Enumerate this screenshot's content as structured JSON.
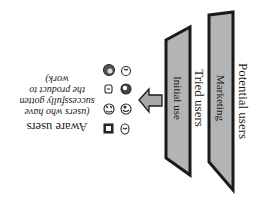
{
  "diagram": {
    "orientation": "rotated-180",
    "colors": {
      "panel_fill": "#b4b4b4",
      "panel_stroke": "#1a1a1a",
      "arrow_fill": "#a8a8a8",
      "text": "#1a1a1a",
      "background": "#ffffff"
    },
    "stages": [
      {
        "outer_label": "Potential users",
        "panel_label": "Marketing"
      },
      {
        "outer_label": "Tried users",
        "panel_label": "Initial use"
      }
    ],
    "arrow": {
      "direction": "toward-aware-users",
      "icon": "block-arrow-icon"
    },
    "user_icons": [
      "user-face-icon",
      "user-face-icon",
      "user-face-icon",
      "user-face-icon",
      "user-face-icon",
      "user-face-icon",
      "user-face-icon",
      "user-face-icon"
    ],
    "result": {
      "title": "Aware users",
      "caption_lines": [
        "(users who have",
        "successfully gotten",
        "the product to",
        "work)"
      ]
    }
  }
}
